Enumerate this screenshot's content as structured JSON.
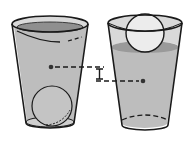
{
  "diagram": {
    "colors": {
      "water": "#bdbdbd",
      "water_surface": "#8f8f8f",
      "glass_top": "#d9d9d9",
      "ball": "#e6e6e6",
      "outline": "#1a1a1a",
      "background": "#ffffff"
    },
    "left_cup": {
      "label": "",
      "ball_position": "sunk (bottom)"
    },
    "right_cup": {
      "label": "",
      "ball_position": "floating (top)"
    },
    "marker": {
      "type": "height-difference bracket",
      "label": ""
    }
  }
}
